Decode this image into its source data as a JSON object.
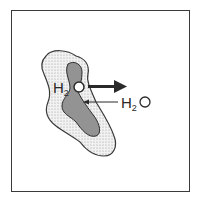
{
  "figure": {
    "labels": {
      "leaving_water": {
        "main": "H",
        "sub": "2",
        "tail": "O"
      },
      "entering_water": {
        "main": "H",
        "sub": "2",
        "tail": "O"
      }
    },
    "arrows": {
      "leaving": "thick arrow pointing right (water exits)",
      "entering": "thin arrow pointing left (water enters)"
    },
    "colors": {
      "border": "#3a3a3a",
      "outer_region": "#d9d9d9",
      "inner_region": "#8f8f8f",
      "ink": "#2a2a2a"
    }
  }
}
